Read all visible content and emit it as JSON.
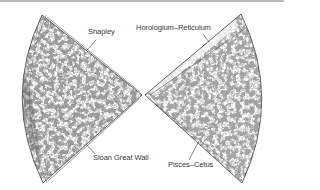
{
  "figure": {
    "type": "redshift-survey-wedge-diagram",
    "wedges": [
      {
        "side": "left",
        "survey_region": "left-cone"
      },
      {
        "side": "right",
        "survey_region": "right-cone"
      }
    ],
    "labels": {
      "shapley": "Shapley",
      "horologium": "Horologium–Reticulum",
      "sloan": "Sloan Great Wall",
      "pisces": "Pisces–Cetus"
    },
    "colors": {
      "galaxy_dense": "#4a4a4a",
      "galaxy_mid": "#7d7d7d",
      "outline": "#444444",
      "background": "#ffffff",
      "top_rule": "#b9b9b9"
    }
  }
}
